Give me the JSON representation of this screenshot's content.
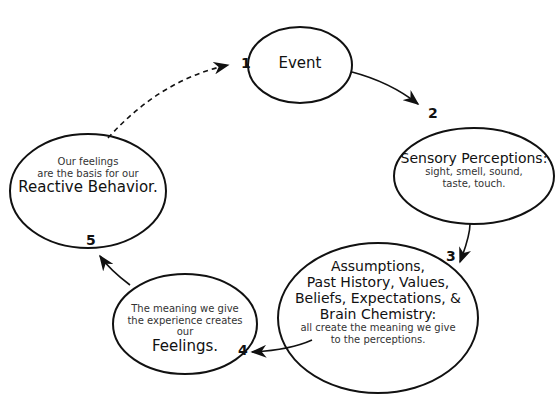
{
  "diagram": {
    "type": "cycle",
    "nodes": [
      {
        "number": "1",
        "title": "Event",
        "lines": []
      },
      {
        "number": "2",
        "title": "Sensory Perceptions:",
        "lines": [
          "sight, smell, sound,",
          "taste, touch."
        ]
      },
      {
        "number": "3",
        "title_lines": [
          "Assumptions,",
          "Past History, Values,",
          "Beliefs, Expectations, &",
          "Brain Chemistry:"
        ],
        "lines": [
          "all create the meaning we give",
          "to the perceptions."
        ]
      },
      {
        "number": "4",
        "lines": [
          "The meaning we give",
          "the experience creates our"
        ],
        "title": "Feelings."
      },
      {
        "number": "5",
        "lines": [
          "Our feelings",
          "are the basis for our"
        ],
        "title": "Reactive Behavior."
      }
    ],
    "edges": [
      {
        "from": "1",
        "to": "2",
        "style": "solid"
      },
      {
        "from": "2",
        "to": "3",
        "style": "solid"
      },
      {
        "from": "3",
        "to": "4",
        "style": "solid"
      },
      {
        "from": "4",
        "to": "5",
        "style": "solid"
      },
      {
        "from": "5",
        "to": "1",
        "style": "dashed"
      }
    ],
    "colors": {
      "stroke": "#111111",
      "background": "#ffffff"
    }
  }
}
